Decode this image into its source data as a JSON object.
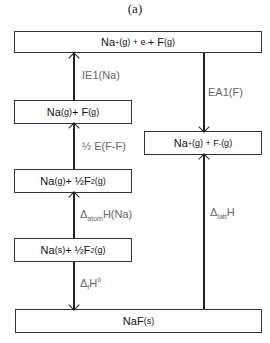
{
  "caption": "(a)",
  "levels": {
    "top": {
      "species": "Na⁺(g) + e⁻ + F(g)",
      "parts": [
        "Na",
        "+",
        "(g) + e",
        "-",
        " + F",
        "(g)"
      ]
    },
    "na_g_f_g": {
      "parts": [
        "Na",
        "(g)",
        " + F",
        "(g)"
      ]
    },
    "na_g_half_f2": {
      "parts": [
        "Na",
        "(g)",
        " + ½F",
        "2",
        "(g)"
      ]
    },
    "na_s_half_f2": {
      "parts": [
        "Na",
        "(s)",
        " + ½F",
        "2",
        "(g)"
      ]
    },
    "ions": {
      "parts": [
        "Na",
        "+",
        "(g) + F",
        "-",
        "(g)"
      ]
    },
    "product": {
      "parts": [
        "NaF",
        "(s)"
      ]
    }
  },
  "steps": {
    "ie1": {
      "label": "IE1(Na)",
      "direction": "up"
    },
    "half_bond": {
      "label": "½ E(F-F)",
      "direction": "up"
    },
    "atom": {
      "label_main": "Δ",
      "label_sub": "atom",
      "label_tail": "H(Na)",
      "direction": "up"
    },
    "formation": {
      "label_main": "Δ",
      "label_sub": "f",
      "label_tail": "H",
      "label_sup": "o",
      "direction": "down"
    },
    "ea1": {
      "label": "EA1(F)",
      "direction": "down"
    },
    "lattice": {
      "label_main": "Δ",
      "label_sub": "latt",
      "label_tail": "H",
      "direction": "up"
    }
  },
  "colors": {
    "line": "#222222",
    "label": "#666666",
    "box_text": "#111111"
  }
}
